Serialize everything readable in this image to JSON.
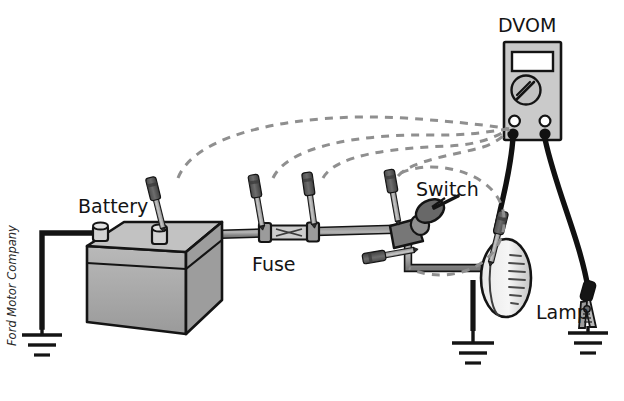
{
  "diagram": {
    "title_visible": false,
    "credit": "Ford Motor Company",
    "labels": {
      "dvom": "DVOM",
      "battery": "Battery",
      "fuse": "Fuse",
      "switch": "Switch",
      "lamp": "Lamp"
    },
    "colors": {
      "outline": "#141414",
      "wire_fill": "#8c8c8c",
      "body_light": "#cfcfcf",
      "body_mid": "#a8a8a8",
      "body_dark": "#6e6e6e",
      "probe_handle": "#5a5a5a",
      "probe_shaft": "#b0b0b0",
      "dashed": "#8f8f8f",
      "lead_black": "#111111",
      "background": "#ffffff",
      "display_fill": "#ffffff"
    },
    "components": [
      {
        "name": "battery",
        "label": "Battery",
        "type": "source",
        "terminals": 2
      },
      {
        "name": "fuse",
        "label": "Fuse",
        "type": "protection"
      },
      {
        "name": "switch",
        "label": "Switch",
        "type": "control"
      },
      {
        "name": "lamp",
        "label": "Lamp",
        "type": "load"
      },
      {
        "name": "dvom",
        "label": "DVOM",
        "type": "meter",
        "jacks": 2
      }
    ],
    "test_points": [
      {
        "index": 1,
        "location": "battery-positive-terminal"
      },
      {
        "index": 2,
        "location": "fuse-input-side"
      },
      {
        "index": 3,
        "location": "fuse-output-side"
      },
      {
        "index": 4,
        "location": "switch-input-side"
      },
      {
        "index": 5,
        "location": "switch-output-side"
      }
    ],
    "ground_symbols": 3
  }
}
